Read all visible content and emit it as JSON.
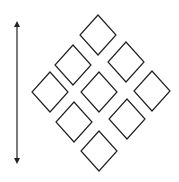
{
  "diagram": {
    "stroke_color": "#222222",
    "background": "#ffffff",
    "arrow": {
      "x": 17,
      "y1": 20,
      "y2": 165,
      "direction": "bidirectional-vertical"
    },
    "diamond_half_width": 18,
    "diamond_half_height": 20,
    "diamonds": [
      {
        "cx": 98,
        "cy": 35
      },
      {
        "cx": 73,
        "cy": 65
      },
      {
        "cx": 126,
        "cy": 62
      },
      {
        "cx": 50,
        "cy": 92
      },
      {
        "cx": 99,
        "cy": 92
      },
      {
        "cx": 152,
        "cy": 91
      },
      {
        "cx": 74,
        "cy": 122
      },
      {
        "cx": 127,
        "cy": 119
      },
      {
        "cx": 99,
        "cy": 151
      }
    ]
  }
}
